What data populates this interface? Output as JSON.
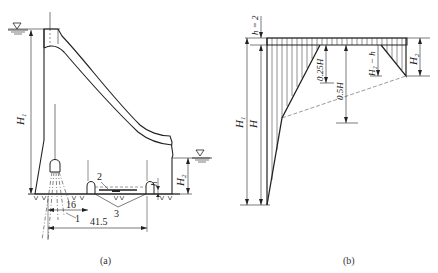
{
  "figure_a": {
    "caption": "(a)",
    "labels": {
      "H1": "H",
      "H1_sub": "1",
      "H2": "H",
      "H2_sub": "2",
      "h": "h",
      "dim_16": "16",
      "dim_41_5": "41.5",
      "item_1": "1",
      "item_2": "2",
      "item_3": "3"
    },
    "water_level_symbol": "▽"
  },
  "figure_b": {
    "caption": "(b)",
    "labels": {
      "h_eq_2": "h = 2",
      "H1": "H",
      "H1_sub": "1",
      "H": "H",
      "H2": "H",
      "H2_sub": "2",
      "quarter_H": "0.25H",
      "half_H": "0.5H",
      "H2_minus_h": "H₂ − h"
    }
  },
  "colors": {
    "line": "#222222",
    "dashed": "#555555",
    "background": "#ffffff"
  }
}
